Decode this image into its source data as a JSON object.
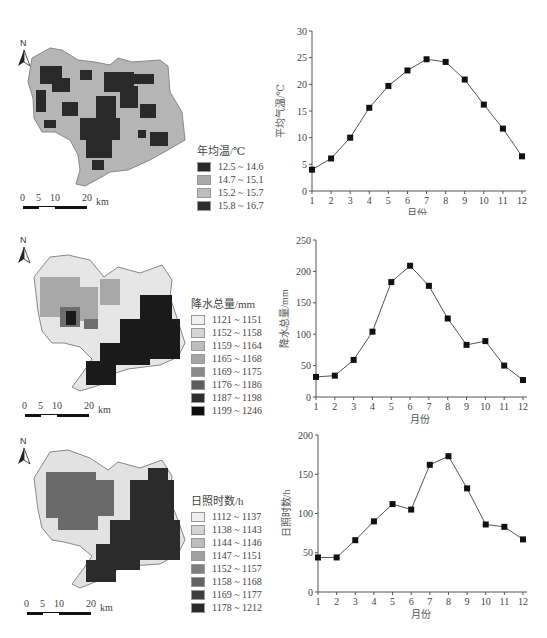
{
  "panels": [
    {
      "map": {
        "legend_title": "年均温/℃",
        "legend": [
          {
            "label": "12.5 ~ 14.6",
            "color": "#2a2a2a"
          },
          {
            "label": "14.7 ~ 15.1",
            "color": "#a9a9a9"
          },
          {
            "label": "15.2 ~ 15.7",
            "color": "#b9b9b9"
          },
          {
            "label": "15.8 ~ 16.7",
            "color": "#2f2f2f"
          }
        ],
        "north": "N",
        "scale": {
          "ticks": [
            "0",
            "5",
            "10",
            "20"
          ],
          "unit": "km"
        }
      }
    },
    {
      "map": {
        "legend_title": "降水总量/mm",
        "legend": [
          {
            "label": "1121 ~ 1151",
            "color": "#f2f2f2"
          },
          {
            "label": "1152 ~ 1158",
            "color": "#d6d6d6"
          },
          {
            "label": "1159 ~ 1164",
            "color": "#bdbdbd"
          },
          {
            "label": "1165 ~ 1168",
            "color": "#a5a5a5"
          },
          {
            "label": "1169 ~ 1175",
            "color": "#8a8a8a"
          },
          {
            "label": "1176 ~ 1186",
            "color": "#5e5e5e"
          },
          {
            "label": "1187 ~ 1198",
            "color": "#2e2e2e"
          },
          {
            "label": "1199 ~ 1246",
            "color": "#0d0d0d"
          }
        ],
        "north": "N",
        "scale": {
          "ticks": [
            "0",
            "5",
            "10",
            "20"
          ],
          "unit": "km"
        }
      }
    },
    {
      "map": {
        "legend_title": "日照时数/h",
        "legend": [
          {
            "label": "1112 ~ 1137",
            "color": "#f0f0f0"
          },
          {
            "label": "1138 ~ 1143",
            "color": "#d4d4d4"
          },
          {
            "label": "1144 ~ 1146",
            "color": "#bcbcbc"
          },
          {
            "label": "1147 ~ 1151",
            "color": "#a0a0a0"
          },
          {
            "label": "1152 ~ 1157",
            "color": "#7f7f7f"
          },
          {
            "label": "1158 ~ 1168",
            "color": "#626262"
          },
          {
            "label": "1169 ~ 1177",
            "color": "#3e3e3e"
          },
          {
            "label": "1178 ~ 1212",
            "color": "#2a2a2a"
          }
        ],
        "north": "N",
        "scale": {
          "ticks": [
            "0",
            "5",
            "10",
            "20"
          ],
          "unit": "km"
        }
      }
    }
  ],
  "chart_data": [
    {
      "type": "line",
      "title": "",
      "xlabel": "月份",
      "ylabel": "平均气温/℃",
      "categories": [
        "1",
        "2",
        "3",
        "4",
        "5",
        "6",
        "7",
        "8",
        "9",
        "10",
        "11",
        "12"
      ],
      "values": [
        4.0,
        6.1,
        10.0,
        15.6,
        19.7,
        22.6,
        24.7,
        24.2,
        20.9,
        16.2,
        11.7,
        6.5
      ],
      "ylim": [
        0,
        30
      ],
      "yticks": [
        0,
        5,
        10,
        15,
        20,
        25,
        30
      ],
      "grid": false,
      "legend": "none"
    },
    {
      "type": "line",
      "title": "",
      "xlabel": "月份",
      "ylabel": "降水总量/mm",
      "categories": [
        "1",
        "2",
        "3",
        "4",
        "5",
        "6",
        "7",
        "8",
        "9",
        "10",
        "11",
        "12"
      ],
      "values": [
        32,
        34,
        59,
        104,
        183,
        209,
        177,
        125,
        83,
        89,
        50,
        27
      ],
      "ylim": [
        0,
        250
      ],
      "yticks": [
        0,
        50,
        100,
        150,
        200,
        250
      ],
      "grid": false,
      "legend": "none"
    },
    {
      "type": "line",
      "title": "",
      "xlabel": "月份",
      "ylabel": "日照时数/h",
      "categories": [
        "1",
        "2",
        "3",
        "4",
        "5",
        "6",
        "7",
        "8",
        "9",
        "10",
        "11",
        "12"
      ],
      "values": [
        44,
        44,
        66,
        90,
        112,
        105,
        162,
        173,
        132,
        86,
        83,
        67
      ],
      "ylim": [
        0,
        200
      ],
      "yticks": [
        0,
        50,
        100,
        150,
        200
      ],
      "grid": false,
      "legend": "none"
    }
  ]
}
